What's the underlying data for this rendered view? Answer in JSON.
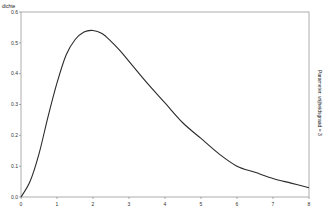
{
  "chart_data": {
    "type": "line",
    "title": "",
    "xlabel": "",
    "ylabel": "dichte",
    "side_label": "Parameter: vrijheidsgraad = 3",
    "xlim": [
      0,
      8
    ],
    "ylim": [
      0,
      0.6
    ],
    "x_ticks": [
      "0",
      "1",
      "2",
      "3",
      "4",
      "5",
      "6",
      "7",
      "8"
    ],
    "y_ticks": [
      "0.0",
      "0.1",
      "0.2",
      "0.3",
      "0.4",
      "0.5",
      "0.6"
    ],
    "grid": false,
    "legend": null,
    "series": [
      {
        "name": "density",
        "color": "#2b2b2b",
        "x": [
          0,
          0.25,
          0.5,
          0.75,
          1,
          1.25,
          1.5,
          1.75,
          2,
          2.25,
          2.5,
          2.75,
          3,
          3.5,
          4,
          4.5,
          5,
          5.5,
          6,
          6.5,
          7,
          7.5,
          8
        ],
        "y": [
          0.0,
          0.05,
          0.14,
          0.26,
          0.37,
          0.46,
          0.51,
          0.535,
          0.54,
          0.53,
          0.505,
          0.475,
          0.44,
          0.37,
          0.305,
          0.24,
          0.19,
          0.14,
          0.1,
          0.08,
          0.06,
          0.045,
          0.03
        ]
      }
    ]
  }
}
